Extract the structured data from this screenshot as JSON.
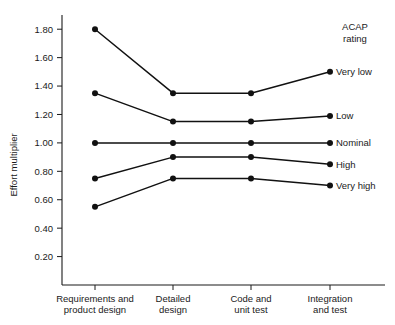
{
  "chart_data": {
    "type": "line",
    "title": "",
    "xlabel": "",
    "ylabel": "Effort multiplier",
    "legend_title_line1": "ACAP",
    "legend_title_line2": "rating",
    "legend_position": "right",
    "grid": false,
    "ylim": [
      0.0,
      1.9
    ],
    "ytick_labels": [
      "0.20",
      "0.40",
      "0.60",
      "0.80",
      "1.00",
      "1.20",
      "1.40",
      "1.60",
      "1.80"
    ],
    "ytick_values": [
      0.2,
      0.4,
      0.6,
      0.8,
      1.0,
      1.2,
      1.4,
      1.6,
      1.8
    ],
    "categories": [
      "Requirements and product design",
      "Detailed design",
      "Code and unit test",
      "Integration and test"
    ],
    "categories_lines": [
      [
        "Requirements and",
        "product design"
      ],
      [
        "Detailed",
        "design"
      ],
      [
        "Code and",
        "unit test"
      ],
      [
        "Integration",
        "and test"
      ]
    ],
    "series": [
      {
        "name": "Very low",
        "values": [
          1.8,
          1.35,
          1.35,
          1.5
        ]
      },
      {
        "name": "Low",
        "values": [
          1.35,
          1.15,
          1.15,
          1.19
        ]
      },
      {
        "name": "Nominal",
        "values": [
          1.0,
          1.0,
          1.0,
          1.0
        ]
      },
      {
        "name": "High",
        "values": [
          0.75,
          0.9,
          0.9,
          0.85
        ]
      },
      {
        "name": "Very high",
        "values": [
          0.55,
          0.75,
          0.75,
          0.7
        ]
      }
    ],
    "line_color": "#111111",
    "marker_color": "#111111",
    "text_color": "#1a1a1a",
    "background_color": "#ffffff"
  }
}
